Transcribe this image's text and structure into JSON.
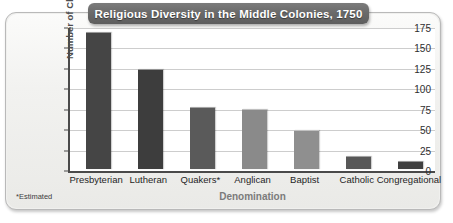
{
  "chart_data": {
    "type": "bar",
    "title": "Religious Diversity in the Middle Colonies, 1750",
    "xlabel": "Denomination",
    "ylabel": "Number of Churches",
    "categories": [
      "Presbyterian",
      "Lutheran",
      "Quakers*",
      "Anglican",
      "Baptist",
      "Catholic",
      "Congregational"
    ],
    "values": [
      167,
      121,
      75,
      72,
      46,
      15,
      8
    ],
    "bar_colors": [
      "#454545",
      "#3d3d3d",
      "#5a5a5a",
      "#8a8a8a",
      "#8f8f8f",
      "#585858",
      "#3f3f3f"
    ],
    "ylim": [
      0,
      175
    ],
    "yticks": [
      0,
      25,
      50,
      75,
      100,
      125,
      150,
      175
    ],
    "ytick_labels": [
      "0",
      "25",
      "50",
      "75",
      "100",
      "125",
      "150",
      "175"
    ],
    "grid": true,
    "legend": false,
    "footnote": "*Estimated"
  },
  "colors": {
    "panel_background": "#f0f0ee",
    "plot_background": "#ffffff",
    "gridline": "#cdcdcd",
    "axis": "#4a4a4a",
    "title_banner": "#6a6a6a",
    "title_text": "#ffffff",
    "axis_title": "#7b7b7b"
  }
}
